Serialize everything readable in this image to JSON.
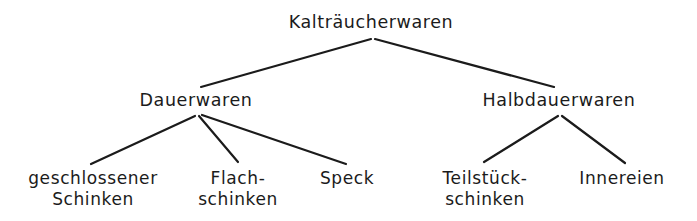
{
  "diagram": {
    "title_node": "Kalträucherwaren",
    "background_color": "#ffffff",
    "line_color": "#1b1b1b",
    "text_color": "#1b1b1b",
    "nodes": {
      "root": {
        "label": "Kalträucherwaren",
        "lines": [
          "Kalträucherwaren"
        ],
        "x": 371,
        "y": 12
      },
      "dauerwaren": {
        "label": "Dauerwaren",
        "lines": [
          "Dauerwaren"
        ],
        "x": 196,
        "y": 90
      },
      "halbdauerwaren": {
        "label": "Halbdauerwaren",
        "lines": [
          "Halbdauerwaren"
        ],
        "x": 559,
        "y": 90
      },
      "geschlossener_schinken": {
        "label": "geschlossener Schinken",
        "lines": [
          "geschlossener",
          "Schinken"
        ],
        "x": 93,
        "y": 168
      },
      "flachschinken": {
        "label": "Flach-schinken",
        "lines": [
          "Flach-",
          "schinken"
        ],
        "x": 238,
        "y": 168
      },
      "speck": {
        "label": "Speck",
        "lines": [
          "Speck"
        ],
        "x": 347,
        "y": 168
      },
      "teilstueckschinken": {
        "label": "Teilstück-schinken",
        "lines": [
          "Teilstück-",
          "schinken"
        ],
        "x": 485,
        "y": 168
      },
      "innereien": {
        "label": "Innereien",
        "lines": [
          "Innereien"
        ],
        "x": 622,
        "y": 168
      }
    },
    "edges": [
      {
        "name": "edge-root-dauerwaren",
        "x1": 371,
        "y1": 39,
        "x2": 201,
        "y2": 87
      },
      {
        "name": "edge-root-halbdauerwaren",
        "x1": 375,
        "y1": 39,
        "x2": 554,
        "y2": 87
      },
      {
        "name": "edge-dauerwaren-geschlossener",
        "x1": 195,
        "y1": 116,
        "x2": 91,
        "y2": 164
      },
      {
        "name": "edge-dauerwaren-flachschinken",
        "x1": 199,
        "y1": 116,
        "x2": 238,
        "y2": 162
      },
      {
        "name": "edge-dauerwaren-speck",
        "x1": 202,
        "y1": 115,
        "x2": 346,
        "y2": 164
      },
      {
        "name": "edge-halbdauerwaren-teilstueck",
        "x1": 558,
        "y1": 116,
        "x2": 484,
        "y2": 162
      },
      {
        "name": "edge-halbdauerwaren-innereien",
        "x1": 562,
        "y1": 116,
        "x2": 625,
        "y2": 163
      }
    ]
  }
}
